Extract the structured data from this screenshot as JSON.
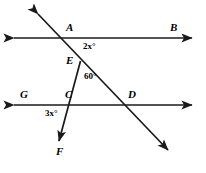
{
  "figure": {
    "stroke_color": "#1a1a1a",
    "background_color": "#ffffff",
    "stroke_width": 1.6
  },
  "points": {
    "A": {
      "label": "A",
      "x": 72,
      "y": 38
    },
    "B": {
      "label": "B",
      "x": 176,
      "y": 38
    },
    "E": {
      "label": "E",
      "x": 80,
      "y": 62
    },
    "G": {
      "label": "G",
      "x": 24,
      "y": 105
    },
    "C": {
      "label": "C",
      "x": 72,
      "y": 105
    },
    "D": {
      "label": "D",
      "x": 133,
      "y": 105
    },
    "F": {
      "label": "F",
      "x": 60,
      "y": 148
    }
  },
  "labels": {
    "A": "A",
    "B": "B",
    "E": "E",
    "G": "G",
    "C": "C",
    "D": "D",
    "F": "F"
  },
  "angles": {
    "at_A": {
      "value": "2x",
      "unit": "°",
      "text": "2x°"
    },
    "at_E": {
      "value": "60",
      "unit": "°",
      "text": "60°"
    },
    "at_C": {
      "value": "3x",
      "unit": "°",
      "text": "3x°"
    }
  },
  "lines": {
    "top_line": {
      "name": "line-AB",
      "from": "left-arrow",
      "to": "right-arrow",
      "y": 38
    },
    "bottom_line": {
      "name": "line-GD",
      "from": "left-arrow",
      "to": "right-arrow",
      "y": 105
    },
    "transversal": {
      "name": "transversal-line",
      "through": "A-E-D"
    },
    "ray_EF": {
      "name": "ray-EF",
      "through": "E-C-F"
    }
  }
}
